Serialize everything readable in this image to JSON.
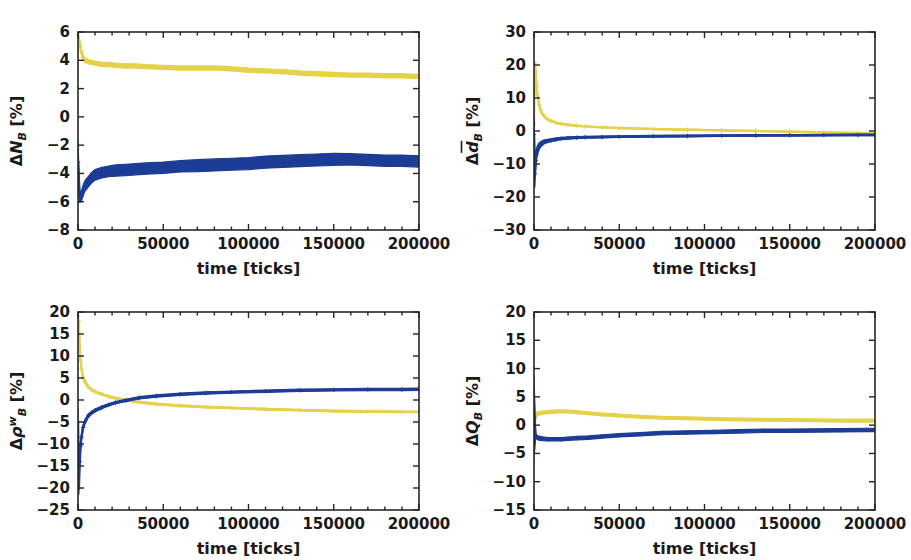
{
  "figure": {
    "background": "#ffffff",
    "width": 911,
    "height": 560,
    "layout": "2x2 grid of line/scatter panels"
  },
  "style": {
    "series_colors": {
      "yellow": "#E5D24B",
      "blue": "#1C3C96"
    },
    "axis_color": "#262626",
    "marker": "plus"
  },
  "chart_data": [
    {
      "id": "panel-NB",
      "type": "line",
      "title": "",
      "xlabel": "time [ticks]",
      "ylabel": "ΔN_B [%]",
      "ylabel_parts": {
        "delta": "Δ",
        "var": "N",
        "sub": "B",
        "sup": "",
        "overbar": false,
        "units": "[%]"
      },
      "xlim": [
        0,
        200000
      ],
      "ylim": [
        -8,
        6
      ],
      "xticks": [
        0,
        50000,
        100000,
        150000,
        200000
      ],
      "xticklabels": [
        "0",
        "50000",
        "100000",
        "150000",
        "200000"
      ],
      "yticks": [
        6,
        4,
        2,
        0,
        -2,
        -4,
        -6,
        -8
      ],
      "yticklabels": [
        "6",
        "4",
        "2",
        "0",
        "−2",
        "−4",
        "−6",
        "−8"
      ],
      "grid": false,
      "legend": "none",
      "series": [
        {
          "name": "yellow",
          "color": "#E5D24B",
          "x": [
            0,
            1000,
            2000,
            3000,
            4000,
            6000,
            8000,
            10000,
            14000,
            18000,
            22000,
            28000,
            34000,
            40000,
            50000,
            60000,
            70000,
            80000,
            90000,
            100000,
            110000,
            120000,
            130000,
            140000,
            150000,
            160000,
            170000,
            180000,
            190000,
            200000
          ],
          "y": [
            5.6,
            5.2,
            4.6,
            4.2,
            4.0,
            3.9,
            3.85,
            3.8,
            3.7,
            3.7,
            3.65,
            3.6,
            3.6,
            3.55,
            3.5,
            3.45,
            3.45,
            3.45,
            3.4,
            3.3,
            3.25,
            3.2,
            3.1,
            3.05,
            3.0,
            2.95,
            2.95,
            2.9,
            2.9,
            2.85
          ],
          "band": [
            1.1,
            0.6,
            0.45,
            0.4,
            0.35,
            0.32,
            0.3,
            0.3,
            0.3,
            0.3,
            0.3,
            0.3,
            0.3,
            0.3,
            0.3,
            0.3,
            0.3,
            0.3,
            0.3,
            0.3,
            0.3,
            0.3,
            0.3,
            0.3,
            0.3,
            0.3,
            0.3,
            0.3,
            0.3,
            0.3
          ]
        },
        {
          "name": "blue",
          "color": "#1C3C96",
          "x": [
            0,
            1000,
            2000,
            3000,
            4000,
            6000,
            8000,
            10000,
            14000,
            18000,
            22000,
            28000,
            34000,
            40000,
            50000,
            60000,
            70000,
            80000,
            90000,
            100000,
            110000,
            120000,
            130000,
            140000,
            150000,
            160000,
            170000,
            180000,
            190000,
            200000
          ],
          "y": [
            -3.2,
            -5.7,
            -5.6,
            -5.2,
            -4.9,
            -4.6,
            -4.3,
            -4.1,
            -3.95,
            -3.85,
            -3.8,
            -3.75,
            -3.7,
            -3.65,
            -3.6,
            -3.5,
            -3.45,
            -3.4,
            -3.35,
            -3.3,
            -3.2,
            -3.15,
            -3.1,
            -3.05,
            -3.0,
            -3.0,
            -3.05,
            -3.1,
            -3.1,
            -3.15
          ],
          "band": [
            3.0,
            0.7,
            0.7,
            0.75,
            0.75,
            0.75,
            0.75,
            0.75,
            0.75,
            0.75,
            0.8,
            0.8,
            0.8,
            0.8,
            0.8,
            0.8,
            0.85,
            0.85,
            0.85,
            0.85,
            0.85,
            0.85,
            0.85,
            0.85,
            0.85,
            0.8,
            0.8,
            0.8,
            0.8,
            0.8
          ]
        }
      ]
    },
    {
      "id": "panel-dB",
      "type": "line",
      "title": "",
      "xlabel": "time [ticks]",
      "ylabel": "Δd̄_B [%]",
      "ylabel_parts": {
        "delta": "Δ",
        "var": "d",
        "sub": "B",
        "sup": "",
        "overbar": true,
        "units": "[%]"
      },
      "xlim": [
        0,
        200000
      ],
      "ylim": [
        -30,
        30
      ],
      "xticks": [
        0,
        50000,
        100000,
        150000,
        200000
      ],
      "xticklabels": [
        "0",
        "50000",
        "100000",
        "150000",
        "200000"
      ],
      "yticks": [
        30,
        20,
        10,
        0,
        -10,
        -20,
        -30
      ],
      "yticklabels": [
        "30",
        "20",
        "10",
        "0",
        "−10",
        "−20",
        "−30"
      ],
      "grid": false,
      "legend": "none",
      "series": [
        {
          "name": "yellow",
          "color": "#E5D24B",
          "x": [
            0,
            500,
            1000,
            1500,
            2000,
            3000,
            4000,
            5000,
            6000,
            8000,
            10000,
            13000,
            16000,
            20000,
            25000,
            30000,
            40000,
            50000,
            70000,
            90000,
            110000,
            130000,
            150000,
            170000,
            190000,
            200000
          ],
          "y": [
            2.0,
            20.4,
            18.0,
            14.0,
            11.0,
            8.0,
            6.2,
            5.2,
            4.5,
            3.5,
            3.0,
            2.5,
            2.2,
            1.9,
            1.6,
            1.4,
            1.1,
            0.9,
            0.6,
            0.4,
            0.2,
            0.0,
            -0.2,
            -0.4,
            -0.6,
            -0.7
          ],
          "band": [
            3.0,
            1.5,
            1.2,
            1.0,
            0.9,
            0.7,
            0.6,
            0.5,
            0.5,
            0.4,
            0.4,
            0.4,
            0.35,
            0.35,
            0.35,
            0.3,
            0.3,
            0.3,
            0.3,
            0.3,
            0.3,
            0.3,
            0.3,
            0.3,
            0.3,
            0.3
          ]
        },
        {
          "name": "blue",
          "color": "#1C3C96",
          "x": [
            0,
            500,
            1000,
            1500,
            2000,
            3000,
            4000,
            5000,
            6000,
            8000,
            10000,
            13000,
            16000,
            20000,
            25000,
            30000,
            40000,
            50000,
            70000,
            90000,
            110000,
            130000,
            150000,
            170000,
            190000,
            200000
          ],
          "y": [
            -1.0,
            -13.0,
            -9.0,
            -7.0,
            -5.8,
            -4.6,
            -4.0,
            -3.6,
            -3.3,
            -3.0,
            -2.8,
            -2.5,
            -2.3,
            -2.1,
            -2.0,
            -1.9,
            -1.8,
            -1.7,
            -1.6,
            -1.5,
            -1.4,
            -1.35,
            -1.3,
            -1.25,
            -1.2,
            -1.2
          ],
          "band": [
            10.0,
            8.0,
            5.0,
            3.5,
            2.8,
            2.0,
            1.6,
            1.4,
            1.2,
            1.0,
            0.9,
            0.8,
            0.7,
            0.7,
            0.6,
            0.6,
            0.55,
            0.5,
            0.5,
            0.5,
            0.5,
            0.45,
            0.45,
            0.45,
            0.45,
            0.45
          ]
        }
      ]
    },
    {
      "id": "panel-rhoB",
      "type": "line",
      "title": "",
      "xlabel": "time [ticks]",
      "ylabel": "Δρ_B^w [%]",
      "ylabel_parts": {
        "delta": "Δ",
        "var": "ρ",
        "sub": "B",
        "sup": "w",
        "overbar": false,
        "units": "[%]"
      },
      "xlim": [
        0,
        200000
      ],
      "ylim": [
        -25,
        20
      ],
      "xticks": [
        0,
        50000,
        100000,
        150000,
        200000
      ],
      "xticklabels": [
        "0",
        "50000",
        "100000",
        "150000",
        "200000"
      ],
      "yticks": [
        20,
        15,
        10,
        5,
        0,
        -5,
        -10,
        -15,
        -20,
        -25
      ],
      "yticklabels": [
        "20",
        "15",
        "10",
        "5",
        "0",
        "−5",
        "−10",
        "−15",
        "−20",
        "−25"
      ],
      "grid": false,
      "legend": "none",
      "series": [
        {
          "name": "yellow",
          "color": "#E5D24B",
          "x": [
            0,
            500,
            1000,
            1500,
            2000,
            3000,
            4000,
            6000,
            8000,
            10000,
            14000,
            18000,
            22000,
            28000,
            36000,
            46000,
            60000,
            75000,
            90000,
            110000,
            130000,
            150000,
            170000,
            190000,
            200000
          ],
          "y": [
            15.0,
            18.0,
            12.0,
            9.0,
            7.2,
            5.2,
            4.2,
            3.0,
            2.3,
            1.9,
            1.3,
            0.8,
            0.4,
            0.0,
            -0.5,
            -0.9,
            -1.3,
            -1.6,
            -1.8,
            -2.1,
            -2.3,
            -2.5,
            -2.6,
            -2.7,
            -2.7
          ],
          "band": [
            5.0,
            2.5,
            1.8,
            1.4,
            1.1,
            0.9,
            0.8,
            0.6,
            0.55,
            0.5,
            0.45,
            0.4,
            0.4,
            0.4,
            0.4,
            0.4,
            0.4,
            0.4,
            0.4,
            0.4,
            0.4,
            0.4,
            0.4,
            0.4,
            0.4
          ]
        },
        {
          "name": "blue",
          "color": "#1C3C96",
          "x": [
            0,
            500,
            1000,
            1500,
            2000,
            3000,
            4000,
            6000,
            8000,
            10000,
            14000,
            18000,
            22000,
            28000,
            36000,
            46000,
            60000,
            75000,
            90000,
            110000,
            130000,
            150000,
            170000,
            190000,
            200000
          ],
          "y": [
            -5.0,
            -20.0,
            -14.0,
            -10.5,
            -8.5,
            -6.2,
            -5.0,
            -3.6,
            -2.9,
            -2.4,
            -1.7,
            -1.1,
            -0.6,
            -0.1,
            0.5,
            0.9,
            1.3,
            1.6,
            1.8,
            2.0,
            2.2,
            2.3,
            2.4,
            2.4,
            2.45
          ],
          "band": [
            6.0,
            3.0,
            2.2,
            1.8,
            1.5,
            1.2,
            1.0,
            0.8,
            0.7,
            0.65,
            0.6,
            0.55,
            0.5,
            0.5,
            0.5,
            0.5,
            0.5,
            0.5,
            0.5,
            0.5,
            0.5,
            0.5,
            0.5,
            0.5,
            0.5
          ]
        }
      ]
    },
    {
      "id": "panel-QB",
      "type": "line",
      "title": "",
      "xlabel": "time [ticks]",
      "ylabel": "ΔQ_B [%]",
      "ylabel_parts": {
        "delta": "Δ",
        "var": "Q",
        "sub": "B",
        "sup": "",
        "overbar": false,
        "units": "[%]"
      },
      "xlim": [
        0,
        200000
      ],
      "ylim": [
        -15,
        20
      ],
      "xticks": [
        0,
        50000,
        100000,
        150000,
        200000
      ],
      "xticklabels": [
        "0",
        "50000",
        "100000",
        "150000",
        "200000"
      ],
      "yticks": [
        20,
        15,
        10,
        5,
        0,
        -5,
        -10,
        -15
      ],
      "yticklabels": [
        "20",
        "15",
        "10",
        "5",
        "0",
        "−5",
        "−10",
        "−15"
      ],
      "grid": false,
      "legend": "none",
      "series": [
        {
          "name": "yellow",
          "color": "#E5D24B",
          "x": [
            0,
            1000,
            2000,
            3000,
            5000,
            8000,
            12000,
            16000,
            20000,
            25000,
            32000,
            40000,
            50000,
            62000,
            75000,
            90000,
            105000,
            120000,
            135000,
            150000,
            165000,
            180000,
            195000,
            200000
          ],
          "y": [
            -1.0,
            1.7,
            2.0,
            2.1,
            2.2,
            2.3,
            2.4,
            2.45,
            2.4,
            2.3,
            2.1,
            1.9,
            1.7,
            1.5,
            1.3,
            1.2,
            1.1,
            1.0,
            0.95,
            0.9,
            0.85,
            0.8,
            0.8,
            0.8
          ],
          "band": [
            12.0,
            0.8,
            0.7,
            0.6,
            0.6,
            0.55,
            0.55,
            0.5,
            0.5,
            0.5,
            0.5,
            0.5,
            0.5,
            0.5,
            0.5,
            0.5,
            0.5,
            0.5,
            0.5,
            0.5,
            0.5,
            0.5,
            0.5,
            0.5
          ]
        },
        {
          "name": "blue",
          "color": "#1C3C96",
          "x": [
            0,
            1000,
            2000,
            3000,
            5000,
            8000,
            12000,
            16000,
            20000,
            25000,
            32000,
            40000,
            50000,
            62000,
            75000,
            90000,
            105000,
            120000,
            135000,
            150000,
            165000,
            180000,
            195000,
            200000
          ],
          "y": [
            1.5,
            -1.9,
            -2.2,
            -2.3,
            -2.4,
            -2.5,
            -2.5,
            -2.5,
            -2.4,
            -2.3,
            -2.2,
            -2.0,
            -1.8,
            -1.6,
            -1.4,
            -1.3,
            -1.2,
            -1.1,
            -1.0,
            -1.0,
            -0.95,
            -0.9,
            -0.85,
            -0.85
          ],
          "band": [
            14.5,
            0.8,
            0.7,
            0.7,
            0.65,
            0.6,
            0.6,
            0.6,
            0.6,
            0.6,
            0.6,
            0.6,
            0.6,
            0.6,
            0.6,
            0.6,
            0.6,
            0.6,
            0.6,
            0.6,
            0.6,
            0.6,
            0.6,
            0.6
          ]
        }
      ]
    }
  ]
}
